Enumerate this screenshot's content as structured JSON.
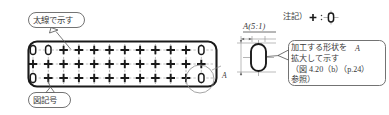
{
  "drawing": {
    "title": "穴あきプレート 図記号説明図",
    "type": "mechanical-drawing",
    "colors": {
      "outline": "#2b2b2b",
      "thick_outline": "#1a1a1a",
      "center_line": "#8d8d8d",
      "callout_border": "#5a5a5a",
      "symbol": "#1a1a1a",
      "background": "#ffffff"
    }
  },
  "callouts": {
    "thick_line": {
      "label": "太線で示す",
      "leader_from": "callout bubble",
      "leader_to": "plate outline"
    },
    "symbol_legend": {
      "label": "図記号"
    },
    "detail_note": {
      "lines": [
        "加工する形状を",
        "拡大して示す",
        "（図 4.20（b）（p.24）",
        "参照）"
      ]
    }
  },
  "note": {
    "prefix": "注記）",
    "symbol": "✛",
    "separator": "：",
    "meaning_shape": "oblong-slot"
  },
  "detail_view": {
    "label": "A(5:1)",
    "zone_letter": "A",
    "shape": "oblong-slot",
    "dimension_marks": [
      "horizontal",
      "vertical"
    ]
  },
  "plate": {
    "zone_letter": "A",
    "rows": [
      {
        "index": 0,
        "symbols": [
          "oval",
          "oval",
          "plus",
          "plus",
          "plus",
          "plus",
          "plus",
          "plus",
          "plus",
          "plus",
          "plus",
          "oval"
        ]
      },
      {
        "index": 1,
        "symbols": [
          "plus",
          "plus",
          "plus",
          "plus",
          "plus",
          "plus",
          "plus",
          "plus",
          "plus",
          "plus",
          "plus",
          "plus"
        ]
      },
      {
        "index": 2,
        "symbols": [
          "oval",
          "plus",
          "plus",
          "plus",
          "plus",
          "plus",
          "plus",
          "plus",
          "plus",
          "plus",
          "plus",
          "oval"
        ]
      }
    ],
    "grid": {
      "columns": 12,
      "row_count": 3,
      "x_start": 33,
      "x_step": 15.3,
      "y_rows": [
        50,
        64,
        78
      ]
    }
  }
}
